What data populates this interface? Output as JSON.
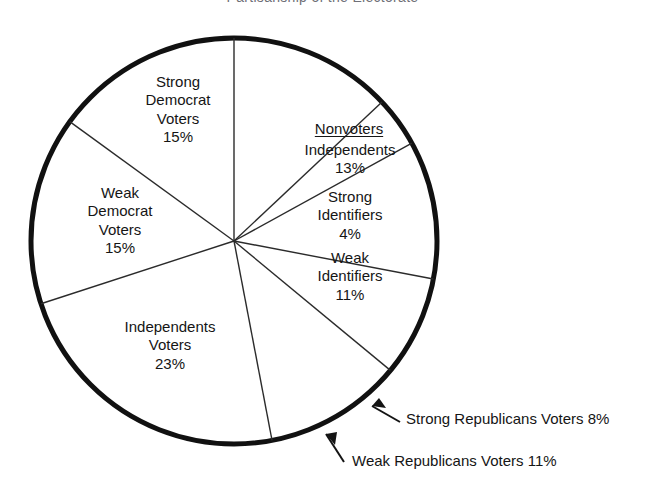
{
  "title": {
    "text": "Partisanship of the Electorate",
    "clipped": true
  },
  "chart_data": {
    "type": "pie",
    "title": "Partisanship of the Electorate",
    "xlabel": "",
    "ylabel": "",
    "grid": false,
    "legend_position": "none",
    "units": "percent",
    "start_angle_deg": 0,
    "direction": "clockwise",
    "total": 100,
    "groups": [
      {
        "name": "Nonvoters",
        "underlined": true,
        "total": 28,
        "members": [
          "Independents",
          "Strong Identifiers",
          "Weak Identifiers"
        ]
      },
      {
        "name": "Voters",
        "underlined": false,
        "total": 72,
        "members": [
          "Strong Republicans Voters",
          "Weak Republicans Voters",
          "Independents Voters",
          "Weak Democrat Voters",
          "Strong Democrat Voters"
        ]
      }
    ],
    "slices": [
      {
        "id": "nv-independents",
        "label": "Independents",
        "group": "Nonvoters",
        "value": 13,
        "value_label": "13%",
        "start_deg": 0,
        "end_deg": 46.8,
        "fill": "#ffffff",
        "divider": "thin"
      },
      {
        "id": "nv-strong",
        "label": "Strong Identifiers",
        "group": "Nonvoters",
        "value": 4,
        "value_label": "4%",
        "start_deg": 46.8,
        "end_deg": 61.2,
        "fill": "#ffffff",
        "divider": "thin"
      },
      {
        "id": "nv-weak",
        "label": "Weak Identifiers",
        "group": "Nonvoters",
        "value": 11,
        "value_label": "11%",
        "start_deg": 61.2,
        "end_deg": 100.8,
        "fill": "#ffffff",
        "divider": "thin"
      },
      {
        "id": "strong-rep",
        "label": "Strong Republicans Voters",
        "group": "Voters",
        "value": 8,
        "value_label": "8%",
        "start_deg": 100.8,
        "end_deg": 129.6,
        "fill": "#ffffff",
        "divider": "thin"
      },
      {
        "id": "weak-rep",
        "label": "Weak Republicans Voters",
        "group": "Voters",
        "value": 11,
        "value_label": "11%",
        "start_deg": 129.6,
        "end_deg": 169.2,
        "fill": "#ffffff",
        "divider": "thin"
      },
      {
        "id": "ind-voters",
        "label": "Independents Voters",
        "group": "Voters",
        "value": 23,
        "value_label": "23%",
        "start_deg": 169.2,
        "end_deg": 252.0,
        "fill": "#ffffff",
        "divider": "thin"
      },
      {
        "id": "weak-dem",
        "label": "Weak Democrat Voters",
        "group": "Voters",
        "value": 15,
        "value_label": "15%",
        "start_deg": 252.0,
        "end_deg": 306.0,
        "fill": "#ffffff",
        "divider": "thin"
      },
      {
        "id": "strong-dem",
        "label": "Strong Democrat Voters",
        "group": "Voters",
        "value": 15,
        "value_label": "15%",
        "start_deg": 306.0,
        "end_deg": 360.0,
        "fill": "#ffffff",
        "divider": "thin"
      }
    ]
  },
  "labels": {
    "strong_democrat": {
      "line1": "Strong",
      "line2": "Democrat",
      "line3": "Voters",
      "pct": "15%"
    },
    "weak_democrat": {
      "line1": "Weak",
      "line2": "Democrat",
      "line3": "Voters",
      "pct": "15%"
    },
    "independents_voters": {
      "line1": "Independents",
      "line2": "Voters",
      "pct": "23%"
    },
    "nonvoters_heading": "Nonvoters",
    "nonvoters_independents": {
      "line1": "Independents",
      "pct": "13%"
    },
    "nonvoters_strong": {
      "line1": "Strong",
      "line2": "Identifiers",
      "pct": "4%"
    },
    "nonvoters_weak": {
      "line1": "Weak",
      "line2": "Identifiers",
      "pct": "11%"
    }
  },
  "callouts": [
    {
      "id": "strong-republicans",
      "text": "Strong Republicans Voters 8%",
      "arrow": "up-left"
    },
    {
      "id": "weak-republicans",
      "text": "Weak Republicans Voters 11%",
      "arrow": "up-left"
    }
  ],
  "style": {
    "outline_color": "#111111",
    "divider_color": "#2b2b2b",
    "slice_fill": "#ffffff",
    "text_color": "#151515",
    "background": "#ffffff",
    "outline_width_px": 5,
    "divider_width_px": 1.4
  },
  "geometry": {
    "center_x": 234,
    "center_y": 241,
    "radius": 203
  }
}
